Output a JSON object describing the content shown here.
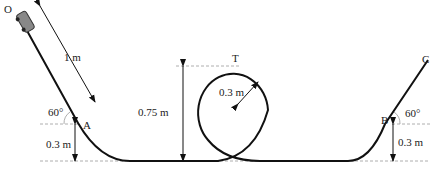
{
  "diagram": {
    "type": "physics-track",
    "points": {
      "O": "O",
      "A": "A",
      "T": "T",
      "B": "B",
      "C": "C"
    },
    "dimensions": {
      "incline_length": "1 m",
      "angle_left": "60°",
      "angle_right": "60°",
      "height_A": "0.3 m",
      "height_B": "0.3 m",
      "loop_height": "0.75 m",
      "loop_radius": "0.3 m"
    },
    "colors": {
      "track": "#111111",
      "dashed": "#999999",
      "car": "#777777"
    }
  }
}
